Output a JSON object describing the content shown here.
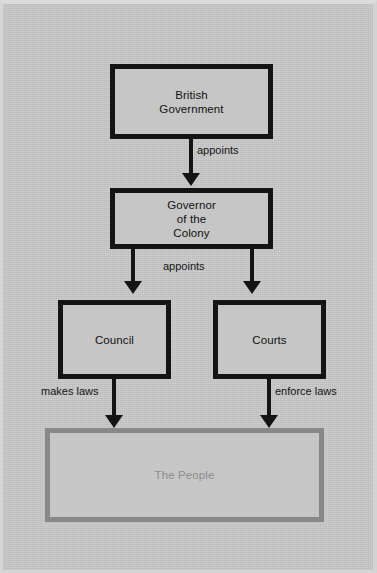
{
  "diagram": {
    "background_color": "#c8c8c8",
    "node_border_color": "#141414",
    "people_border_color": "#888888",
    "people_text_color": "#8d8d8d",
    "nodes": [
      {
        "id": "british",
        "label_line1": "British",
        "label_line2": "Government"
      },
      {
        "id": "governor",
        "label_line1": "Governor",
        "label_line2": "of the",
        "label_line3": "Colony"
      },
      {
        "id": "council",
        "label_line1": "Council"
      },
      {
        "id": "courts",
        "label_line1": "Courts"
      },
      {
        "id": "people",
        "label_line1": "The People"
      }
    ],
    "edges": [
      {
        "id": "british-to-governor",
        "label": "appoints"
      },
      {
        "id": "governor-to-branches",
        "label": "appoints"
      },
      {
        "id": "council-to-people",
        "label": "makes laws"
      },
      {
        "id": "courts-to-people",
        "label": "enforce laws"
      }
    ]
  }
}
